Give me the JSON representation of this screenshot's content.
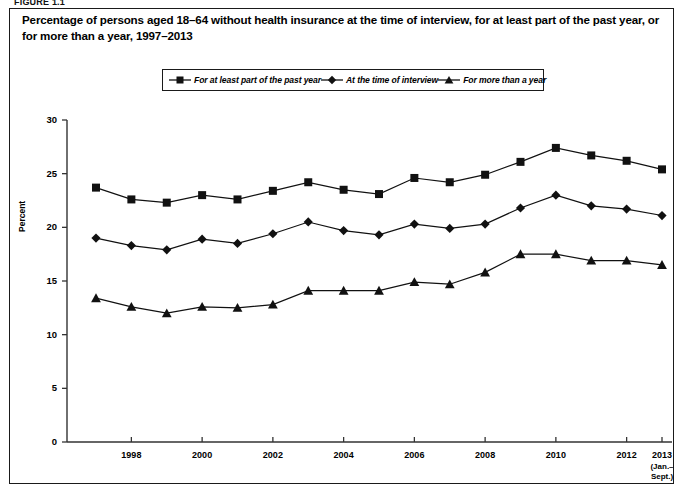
{
  "figure_label": "FIGURE 1.1",
  "title": "Percentage of persons aged 18–64 without health insurance at the time of interview, for at least part of the past year, or for more than a year, 1997–2013",
  "legend": [
    {
      "label": "For at least part of the past year",
      "marker": "square-marker-icon"
    },
    {
      "label": "At the time of interview",
      "marker": "diamond-marker-icon"
    },
    {
      "label": "For more than a year",
      "marker": "triangle-marker-icon"
    }
  ],
  "axis": {
    "ylabel": "Percent",
    "yticks": [
      "0",
      "5",
      "10",
      "15",
      "20",
      "25",
      "30"
    ],
    "xticks": [
      "1998",
      "2000",
      "2002",
      "2004",
      "2006",
      "2008",
      "2010",
      "2012",
      "2013"
    ],
    "xtick_sub": [
      "",
      "",
      "",
      "",
      "",
      "",
      "",
      "",
      "(Jan.–\nSept.)"
    ]
  },
  "colors": {
    "ink": "#111111",
    "line": "#1a1a1a",
    "background": "#ffffff"
  },
  "chart_data": {
    "type": "line",
    "title": "Percentage of persons aged 18–64 without health insurance at the time of interview, for at least part of the past year, or for more than a year, 1997–2013",
    "xlabel": "",
    "ylabel": "Percent",
    "ylim": [
      0,
      30
    ],
    "xlim": [
      1997,
      2013
    ],
    "grid": false,
    "legend_position": "top-center",
    "x": [
      1997,
      1998,
      1999,
      2000,
      2001,
      2002,
      2003,
      2004,
      2005,
      2006,
      2007,
      2008,
      2009,
      2010,
      2011,
      2012,
      2013
    ],
    "xtick_labels": [
      "1998",
      "2000",
      "2002",
      "2004",
      "2006",
      "2008",
      "2010",
      "2012",
      "2013 (Jan.–Sept.)"
    ],
    "series": [
      {
        "name": "For at least part of the past year",
        "marker": "square",
        "values": [
          23.7,
          22.6,
          22.3,
          23.0,
          22.6,
          23.4,
          24.2,
          23.5,
          23.1,
          24.6,
          24.2,
          24.9,
          26.1,
          27.4,
          26.7,
          26.2,
          25.4
        ]
      },
      {
        "name": "At the time of interview",
        "marker": "diamond",
        "values": [
          19.0,
          18.3,
          17.9,
          18.9,
          18.5,
          19.4,
          20.5,
          19.7,
          19.3,
          20.3,
          19.9,
          20.3,
          21.8,
          23.0,
          22.0,
          21.7,
          21.1
        ]
      },
      {
        "name": "For more than a year",
        "marker": "triangle",
        "values": [
          13.4,
          12.6,
          12.0,
          12.6,
          12.5,
          12.8,
          14.1,
          14.1,
          14.1,
          14.9,
          14.7,
          15.8,
          17.5,
          17.5,
          16.9,
          16.9,
          16.5
        ]
      }
    ]
  }
}
